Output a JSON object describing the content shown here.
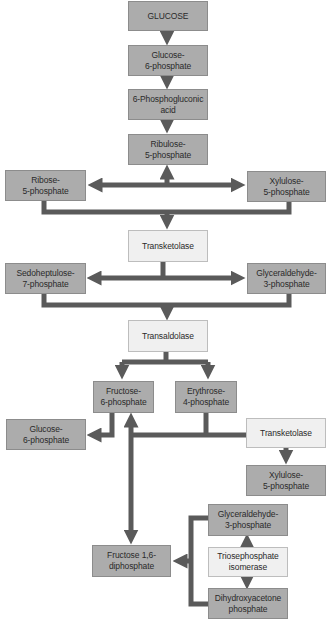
{
  "colors": {
    "metabolite_box": "#acacac",
    "enzyme_box": "#f0f0f0",
    "arrow": "#5a5a5a"
  },
  "nodes": {
    "glucose": "GLUCOSE",
    "g6p_top": "Glucose-\n6-phosphate",
    "phosphogluconic": "6-Phosphogluconic\nacid",
    "ribulose5p": "Ribulose-\n5-phosphate",
    "ribose5p": "Ribose-\n5-phosphate",
    "xylulose5p_top": "Xylulose-\n5-phosphate",
    "transketolase_1": "Transketolase",
    "sedoheptulose7p": "Sedoheptulose-\n7-phosphate",
    "glyceraldehyde3p_top": "Glyceraldehyde-\n3-phosphate",
    "transaldolase": "Transaldolase",
    "fructose6p": "Fructose-\n6-phosphate",
    "erythrose4p": "Erythrose-\n4-phosphate",
    "g6p_left": "Glucose-\n6-phosphate",
    "transketolase_2": "Transketolase",
    "xylulose5p_bottom": "Xylulose-\n5-phosphate",
    "glyceraldehyde3p_bottom": "Glyceraldehyde-\n3-phosphate",
    "triosephosphate_isomerase": "Triosephosphate\nisomerase",
    "dhap": "Dihydroxyacetone\nphosphate",
    "fructose16dp": "Fructose 1,6-\ndiphosphate"
  }
}
